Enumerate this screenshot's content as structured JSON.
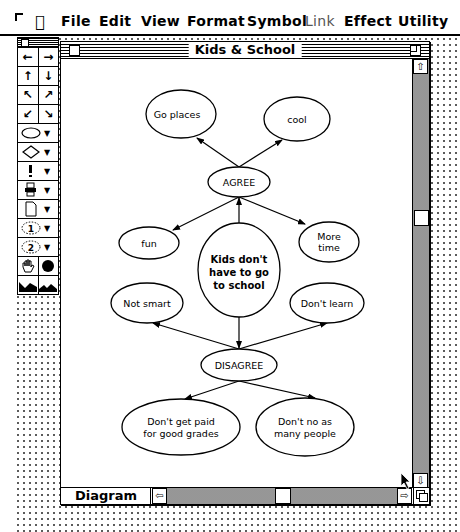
{
  "menubar": {
    "apple_icon": "apple-icon",
    "items": [
      {
        "label": "File",
        "enabled": true
      },
      {
        "label": "Edit",
        "enabled": true
      },
      {
        "label": "View",
        "enabled": true
      },
      {
        "label": "Format",
        "enabled": true
      },
      {
        "label": "Symbol",
        "enabled": true
      },
      {
        "label": "Link",
        "enabled": false
      },
      {
        "label": "Effect",
        "enabled": true
      },
      {
        "label": "Utility",
        "enabled": true
      }
    ]
  },
  "palette": {
    "rows": [
      {
        "tools": [
          "arrow-left",
          "arrow-right"
        ],
        "glyphs": [
          "←",
          "→"
        ]
      },
      {
        "tools": [
          "arrow-up",
          "arrow-down"
        ],
        "glyphs": [
          "↑",
          "↓"
        ]
      },
      {
        "tools": [
          "arrow-up-left",
          "arrow-up-right"
        ],
        "glyphs": [
          "↖",
          "↗"
        ]
      },
      {
        "tools": [
          "arrow-down-left",
          "arrow-down-right"
        ],
        "glyphs": [
          "↙",
          "↘"
        ]
      },
      {
        "tools": [
          "ellipse-shape"
        ],
        "glyphs": [
          "⬭"
        ]
      },
      {
        "tools": [
          "diamond-shape"
        ],
        "glyphs": [
          "◇"
        ]
      },
      {
        "tools": [
          "exclamation-symbol"
        ],
        "glyphs": [
          "!"
        ]
      },
      {
        "tools": [
          "stamp-symbol"
        ],
        "glyphs": [
          "♖"
        ]
      },
      {
        "tools": [
          "document-shape"
        ],
        "glyphs": [
          "▯"
        ]
      },
      {
        "tools": [
          "numbered-1"
        ],
        "glyphs": [
          "1"
        ]
      },
      {
        "tools": [
          "numbered-2"
        ],
        "glyphs": [
          "2"
        ]
      },
      {
        "tools": [
          "hand-grab",
          "fill-circle"
        ],
        "glyphs": [
          "✋",
          "●"
        ]
      },
      {
        "tools": [
          "landscape-filled",
          "landscape-outline"
        ],
        "glyphs": [
          "◢",
          "◣"
        ]
      }
    ]
  },
  "window": {
    "title": "Kids & School",
    "view_label": "Diagram"
  },
  "diagram": {
    "center": {
      "label_lines": [
        "Kids don't",
        "have to go",
        "to school"
      ]
    },
    "agree": {
      "label": "AGREE"
    },
    "disagree": {
      "label": "DISAGREE"
    },
    "nodes": {
      "go_places": {
        "label_lines": [
          "Go places"
        ]
      },
      "cool": {
        "label_lines": [
          "cool"
        ]
      },
      "fun": {
        "label_lines": [
          "fun"
        ]
      },
      "more_time": {
        "label_lines": [
          "More",
          "time"
        ]
      },
      "not_smart": {
        "label_lines": [
          "Not smart"
        ]
      },
      "dont_learn": {
        "label_lines": [
          "Don't learn"
        ]
      },
      "dont_get_paid": {
        "label_lines": [
          "Don't get paid",
          "for good grades"
        ]
      },
      "dont_no": {
        "label_lines": [
          "Don't no as",
          "many people"
        ]
      }
    }
  }
}
